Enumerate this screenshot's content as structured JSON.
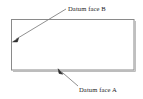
{
  "drawing": {
    "title": "Datum faces annotation diagram",
    "canvas": {
      "width": 143,
      "height": 99
    },
    "background_color": "#ffffff",
    "line_color": "#8a8a8a",
    "shadow_color": "#b9b9b9",
    "text_color": "#1d1d1d",
    "part": {
      "name": "rectangular-part",
      "shape": "rectangle",
      "x": 11,
      "y": 19,
      "width": 123,
      "height": 51
    },
    "annotations": [
      {
        "id": "datum-b",
        "label": "Datum face B",
        "label_x": 68,
        "label_y": 10.5,
        "leader_start_x": 66,
        "leader_start_y": 9,
        "leader_end_x": 13.5,
        "leader_end_y": 41.5,
        "target_face": "left"
      },
      {
        "id": "datum-a",
        "label": "Datum face A",
        "label_x": 79,
        "label_y": 91.5,
        "leader_start_x": 78,
        "leader_start_y": 86,
        "leader_end_x": 58.5,
        "leader_end_y": 69,
        "target_face": "bottom"
      }
    ]
  }
}
